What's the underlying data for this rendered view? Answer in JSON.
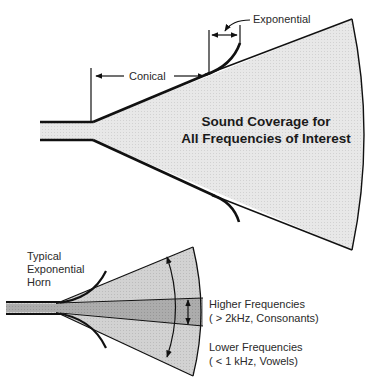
{
  "top_horn": {
    "labels": {
      "exponential": "Exponential",
      "conical": "Conical",
      "coverage_line1": "Sound Coverage for",
      "coverage_line2": "All Frequencies of Interest"
    }
  },
  "bottom_horn": {
    "labels": {
      "title_line1": "Typical",
      "title_line2": "Exponential",
      "title_line3": "Horn",
      "higher_line1": "Higher Frequencies",
      "higher_line2": "( > 2kHz, Consonants)",
      "lower_line1": "Lower Frequencies",
      "lower_line2": "( < 1 kHz, Vowels)"
    }
  },
  "colors": {
    "fill_light": "#e6e6e6",
    "fill_medium": "#d0d0d0",
    "fill_dark": "#a8a8a8",
    "stroke": "#111111"
  }
}
